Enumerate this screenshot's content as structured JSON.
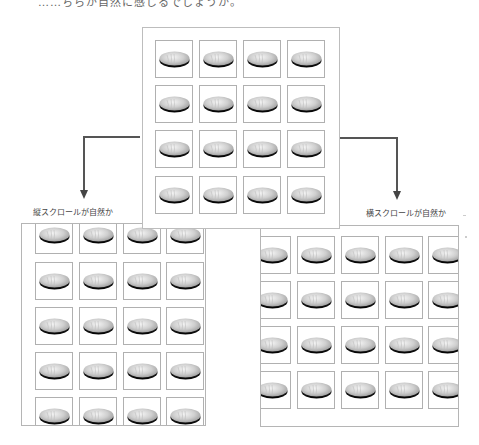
{
  "caption": {
    "top_text": "……ちらが自然に感じるでしょうか。"
  },
  "labels": {
    "vertical": "縦スクロールが自然か",
    "horizontal": "横スクロールが自然か"
  },
  "icons": {
    "tile_icon": "bowl-icon",
    "arrow": "arrow-down-icon"
  },
  "colors": {
    "frame_border": "#b5b5b5",
    "tile_border": "#b0b0b0",
    "arrow": "#555555",
    "bowl_top": "#d8d8d8",
    "bowl_rim": "#111111"
  },
  "grids": {
    "center": {
      "columns": 4,
      "rows": 4,
      "tile_count": 16
    },
    "vertical_scroll": {
      "columns": 4,
      "rows_visible": 5,
      "cropped": "top and bottom"
    },
    "horizontal_scroll": {
      "columns_visible": 5,
      "rows": 4,
      "cropped": "left and right"
    }
  }
}
